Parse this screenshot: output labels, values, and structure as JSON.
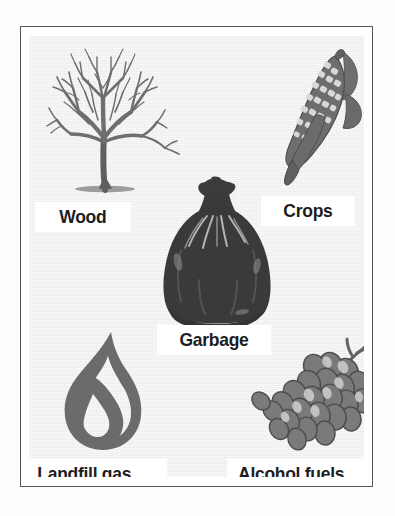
{
  "figure": {
    "background_color": "#ebebeb",
    "frame_color": "#55565a",
    "label_background": "#ffffff",
    "label_text_color": "#1d1d1f",
    "artwork_color": "#6b6b6b",
    "artwork_dark_color": "#3a3a3a"
  },
  "items": [
    {
      "id": "wood",
      "label": "Wood",
      "icon": "bare-tree-icon",
      "position": "top-left"
    },
    {
      "id": "crops",
      "label": "Crops",
      "icon": "corn-cob-icon",
      "position": "top-right"
    },
    {
      "id": "garbage",
      "label": "Garbage",
      "icon": "tied-trash-bag-icon",
      "position": "center"
    },
    {
      "id": "landfill-gas",
      "label": "Landfill gas",
      "icon": "flame-icon",
      "position": "bottom-left"
    },
    {
      "id": "alcohol-fuels",
      "label": "Alcohol fuels",
      "icon": "grape-bunch-icon",
      "position": "bottom-right"
    }
  ]
}
